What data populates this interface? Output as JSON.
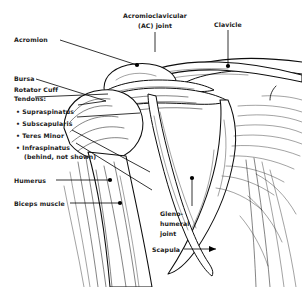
{
  "figure": {
    "type": "anatomical-line-drawing",
    "ink_color": "#0d0d0d",
    "background_color": "#ffffff",
    "label_color": "#1a1a1a"
  },
  "labels": {
    "acromioclavicular_line1": "Acromioclavicular",
    "acromioclavicular_line2": "(AC) joint",
    "clavicle": "Clavicle",
    "acromion": "Acromion",
    "bursa": "Bursa",
    "rotator_cuff_line1": "Rotator Cuff",
    "rotator_cuff_line2": "Tendons:",
    "supraspinatus": "• Supraspinatus",
    "subscapularis": "• Subscapularis",
    "teres_minor": "• Teres Minor",
    "infraspinatus": "• Infraspinatus",
    "infraspinatus_note": "(behind, not shown)",
    "humerus": "Humerus",
    "biceps_muscle": "Biceps muscle",
    "glenohumeral_line1": "Gleno-",
    "glenohumeral_line2": "humeral",
    "glenohumeral_line3": "joint",
    "scapula": "Scapula"
  }
}
